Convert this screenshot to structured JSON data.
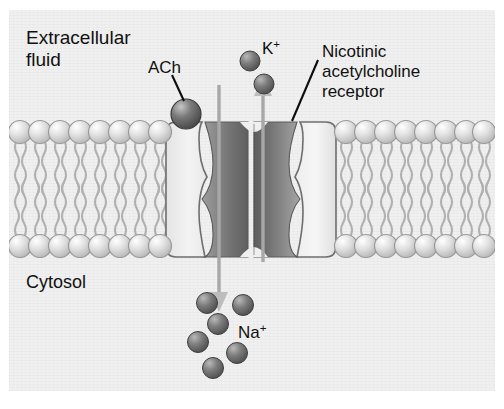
{
  "figure": {
    "background_color": "#f0f0f0",
    "frame_color": "#ffffff"
  },
  "labels": {
    "extracellular": "Extracellular\nfluid",
    "cytosol": "Cytosol",
    "ach": "ACh",
    "potassium": "K",
    "potassium_charge": "+",
    "sodium": "Na",
    "sodium_charge": "+",
    "receptor": "Nicotinic\nacetylcholine\nreceptor"
  },
  "structures": {
    "membrane": {
      "name": "phospholipid-bilayer",
      "head_color": "#d7d7d7",
      "tail_color": "#b9b9b9",
      "upper_leaflet_heads_left": 8,
      "upper_leaflet_heads_right": 9,
      "lower_leaflet_heads_left": 8,
      "lower_leaflet_heads_right": 9
    },
    "receptor_channel": {
      "name": "nicotinic-acetylcholine-receptor",
      "subunit_fill": "#ececec",
      "pore_lining_fill": "#8c8c8c",
      "outline_color": "#6e6e6e",
      "shape": "hourglass-pore"
    },
    "ions": {
      "ach_molecule_count": 1,
      "potassium_ion_count": 2,
      "sodium_ion_count": 6,
      "ion_color": "#6b6b6b"
    },
    "arrows": {
      "potassium_efflux_direction": "up",
      "sodium_influx_direction": "down",
      "arrow_color": "#a8a8a8"
    }
  }
}
